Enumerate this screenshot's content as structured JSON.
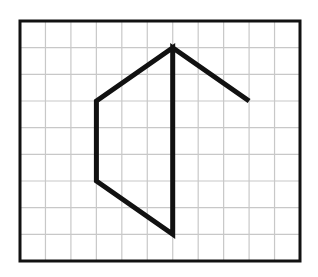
{
  "diagram": {
    "grid": {
      "columns": 11,
      "rows": 9,
      "x0": 20,
      "y0": 21,
      "x1": 300,
      "y1": 261,
      "line_color": "#c8c8c8",
      "border_color": "#111111"
    },
    "polyline": {
      "color": "#111111",
      "points_grid": [
        [
          6,
          4
        ],
        [
          6,
          1
        ],
        [
          3,
          3
        ],
        [
          3,
          6
        ],
        [
          6,
          8
        ],
        [
          6,
          1
        ],
        [
          9,
          3
        ]
      ],
      "note": "points given as [column, row] grid intersections from top-left"
    }
  }
}
